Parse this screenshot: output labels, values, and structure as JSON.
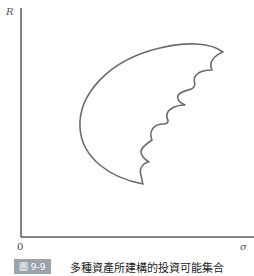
{
  "figure": {
    "y_axis_label": "R",
    "x_axis_label": "σ",
    "origin_label": "0",
    "caption_number": "圖 9-9",
    "caption_text": "多種資產所建構的投資可能集合"
  },
  "colors": {
    "curve": "#6b6b6b",
    "axis": "#5a5a5a",
    "badge": "#9aa3ab"
  }
}
